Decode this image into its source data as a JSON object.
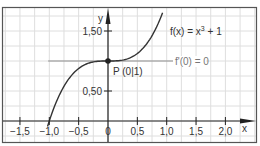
{
  "chart_data": {
    "type": "line",
    "title": "",
    "xlabel": "x",
    "ylabel": "y",
    "xlim": [
      -1.75,
      2.5
    ],
    "ylim": [
      -0.35,
      1.85
    ],
    "grid": true,
    "grid_step": 0.25,
    "x_ticks": [
      -1.5,
      -1.0,
      -0.5,
      0,
      0.5,
      1.0,
      1.5,
      2.0
    ],
    "x_tick_labels": [
      "−1,5",
      "−1,0",
      "−0,5",
      "0",
      "0,5",
      "1,0",
      "1,5",
      "2,0"
    ],
    "y_ticks": [
      0.5,
      1.5
    ],
    "y_tick_labels": [
      "0,50",
      "1,50"
    ],
    "series": [
      {
        "name": "f(x) = x³ + 1",
        "function": "x^3 + 1",
        "x": [
          -1.0,
          -0.75,
          -0.5,
          -0.25,
          0,
          0.25,
          0.5,
          0.75,
          0.93
        ],
        "values": [
          0,
          0.578,
          0.875,
          0.984,
          1.0,
          1.016,
          1.125,
          1.422,
          1.804
        ],
        "color": "#333333"
      },
      {
        "name": "f'(0) = 0",
        "function": "tangent y = 1",
        "x": [
          -1.02,
          1.65
        ],
        "values": [
          1,
          1
        ],
        "color": "#8a8a8a"
      }
    ],
    "annotations": [
      {
        "text": "P (0|1)",
        "x": 0,
        "y": 1,
        "marker": "point"
      },
      {
        "text": "f(x) = x³ + 1",
        "near": "upper right of curve"
      },
      {
        "text": "f'(0) = 0",
        "near": "tangent line right end"
      }
    ]
  },
  "labels": {
    "x_axis": "x",
    "y_axis": "y",
    "point": "P (0|1)",
    "function": "f(x) = x",
    "function_exp": "3",
    "function_tail": " + 1",
    "tangent": "f'(0) = 0"
  },
  "colors": {
    "frame": "#555555",
    "grid": "#dedede",
    "axis": "#222222",
    "curve": "#333333",
    "tangent": "#8f8f8f",
    "text": "#333333",
    "tangent_text": "#777777"
  }
}
